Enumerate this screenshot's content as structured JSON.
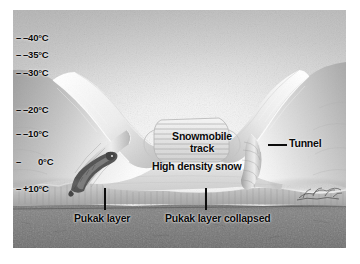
{
  "figure": {
    "type": "cross-section-illustration",
    "style": "grayscale airbrush scientific illustration",
    "canvas": {
      "x": 13,
      "y": 10,
      "width": 333,
      "height": 238
    }
  },
  "temperature_scale": {
    "axis_label": "",
    "unit": "°C",
    "tick_marker": "–",
    "ticks": [
      {
        "label": "–40°C",
        "value": -40,
        "y": 28
      },
      {
        "label": "–35°C",
        "value": -35,
        "y": 45
      },
      {
        "label": "–30°C",
        "value": -30,
        "y": 63
      },
      {
        "label": "–20°C",
        "value": -20,
        "y": 100
      },
      {
        "label": "–10°C",
        "value": -10,
        "y": 124
      },
      {
        "label": "0°C",
        "value": 0,
        "y": 152
      },
      {
        "label": "+10°C",
        "value": 10,
        "y": 179
      }
    ]
  },
  "annotations": [
    {
      "id": "snowmobile-track",
      "label": "Snowmobile\ntrack",
      "line1": "Snowmobile",
      "line2": "track"
    },
    {
      "id": "high-density-snow",
      "label": "High density snow"
    },
    {
      "id": "tunnel",
      "label": "Tunnel"
    },
    {
      "id": "pukak-layer",
      "label": "Pukak layer"
    },
    {
      "id": "pukak-layer-collapsed",
      "label": "Pukak layer collapsed"
    }
  ],
  "layers": [
    {
      "id": "sky",
      "name": "Sky / air"
    },
    {
      "id": "snow-drift-left",
      "name": "Left snow drift"
    },
    {
      "id": "snow-drift-right",
      "name": "Right snow drift"
    },
    {
      "id": "high-density-snow",
      "name": "High density snow"
    },
    {
      "id": "snowmobile-track",
      "name": "Compacted snowmobile track"
    },
    {
      "id": "pukak-layer",
      "name": "Pukak layer (depth hoar)"
    },
    {
      "id": "ground",
      "name": "Ground / soil"
    }
  ],
  "fauna": [
    {
      "id": "lemming",
      "name": "Lemming in pukak layer"
    },
    {
      "id": "vegetation",
      "name": "Vegetation under snow"
    }
  ],
  "colors": {
    "text": "#0a0a0a",
    "sky_top": "#b6b6b6",
    "sky_bright": "#fbfbfb",
    "snow_light": "#f4f4f4",
    "snow_mid": "#d8d8d8",
    "snow_shadow": "#9a9a9a",
    "ground": "#7b7b7b",
    "ground_dark": "#5e5e5e",
    "frame": "#ffffff"
  }
}
